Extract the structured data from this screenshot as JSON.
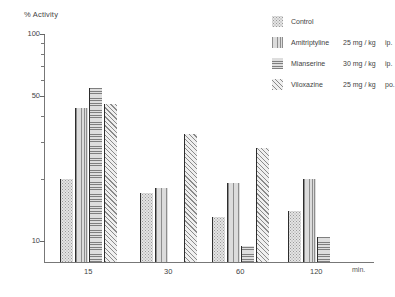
{
  "chart_data": {
    "type": "bar",
    "title": "",
    "ylabel": "% Activity",
    "xlabel": "min.",
    "yscale": "log",
    "ylim": [
      7,
      100
    ],
    "ytick_values": [
      100,
      50,
      10
    ],
    "ytick_labels": [
      "100",
      "50",
      "10"
    ],
    "yminor_ticks": [
      90,
      80,
      70,
      60,
      40,
      30,
      20
    ],
    "grid": false,
    "legend_position": "top-right",
    "categories": [
      "15",
      "30",
      "60",
      "120"
    ],
    "series": [
      {
        "name": "Control",
        "dose": "",
        "route": "",
        "pattern": "dotted",
        "values": [
          20,
          17,
          13,
          14
        ]
      },
      {
        "name": "Amitriptyline",
        "dose": "25 mg / kg",
        "route": "ip.",
        "pattern": "vertical-lines",
        "values": [
          44,
          18,
          19,
          20
        ]
      },
      {
        "name": "Mianserine",
        "dose": "30 mg / kg",
        "route": "ip.",
        "pattern": "horizontal-lines",
        "values": [
          55,
          7,
          9.5,
          10.5
        ]
      },
      {
        "name": "Viloxazine",
        "dose": "25 mg / kg",
        "route": "po.",
        "pattern": "diagonal-hatch",
        "values": [
          46,
          33,
          28,
          null
        ]
      }
    ]
  },
  "axis": {
    "y_title": "% Activity",
    "y_labels": [
      "100",
      "50",
      "10"
    ],
    "x_labels": [
      "15",
      "30",
      "60",
      "120"
    ],
    "x_unit": "min."
  },
  "legend": {
    "entries": [
      {
        "name": "Control",
        "dose": "",
        "route": ""
      },
      {
        "name": "Amitriptyline",
        "dose": "25 mg / kg",
        "route": "ip."
      },
      {
        "name": "Mianserine",
        "dose": "30 mg / kg",
        "route": "ip."
      },
      {
        "name": "Viloxazine",
        "dose": "25 mg / kg",
        "route": "po."
      }
    ]
  },
  "colors": {
    "axis": "#777777",
    "text": "#3f3f3f",
    "bar_edge": "#2d2d2d"
  }
}
